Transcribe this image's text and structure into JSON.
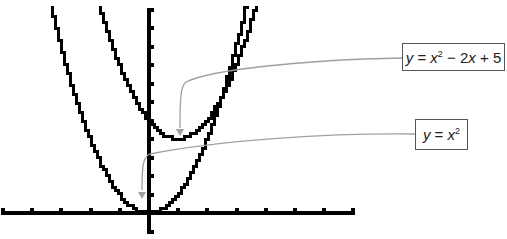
{
  "chart_data": {
    "type": "line",
    "title": "",
    "xlabel": "",
    "ylabel": "",
    "xlim": [
      -5,
      7
    ],
    "ylim": [
      -1,
      11
    ],
    "x_ticks": [
      -5,
      -4,
      -3,
      -2,
      -1,
      0,
      1,
      2,
      3,
      4,
      5,
      6,
      7
    ],
    "y_ticks": [
      -1,
      0,
      1,
      2,
      3,
      4,
      5,
      6,
      7,
      8,
      9,
      10,
      11
    ],
    "tick_labels_shown": false,
    "grid": false,
    "style": "pixelated graphing-calculator plot",
    "series": [
      {
        "name": "y = x^2",
        "expression": "x^2",
        "coefficients": {
          "a": 1,
          "b": 0,
          "c": 0
        },
        "vertex": [
          0,
          0
        ],
        "color": "#000000"
      },
      {
        "name": "y = x^2 - 2x + 5",
        "expression": "x^2 - 2x + 5",
        "coefficients": {
          "a": 1,
          "b": -2,
          "c": 5
        },
        "vertex": [
          1,
          4
        ],
        "color": "#000000"
      }
    ],
    "annotations": [
      {
        "target_series": 1,
        "points_to": [
          1,
          4
        ],
        "label_id": "label1"
      },
      {
        "target_series": 0,
        "points_to": [
          0,
          0
        ],
        "label_id": "label2"
      }
    ]
  },
  "labels": {
    "label1": {
      "y": "y",
      "eq": " = ",
      "x": "x",
      "exp": "2",
      "rest1": " − 2",
      "x2": "x",
      "rest2": " + 5"
    },
    "label2": {
      "y": "y",
      "eq": " = ",
      "x": "x",
      "exp": "2"
    }
  },
  "colors": {
    "curve": "#000000",
    "axis": "#000000",
    "callout": "#a0a0a0",
    "box_border": "#555555"
  }
}
